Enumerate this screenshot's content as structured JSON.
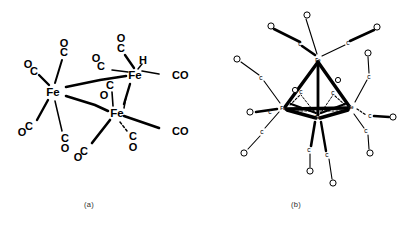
{
  "figure": {
    "background": "#ffffff",
    "ink": "#000000",
    "width": 407,
    "height": 229,
    "captions": [
      {
        "id": "a",
        "label": "(a)"
      },
      {
        "id": "b",
        "label": "(b)"
      }
    ]
  },
  "panel_a": {
    "name": "hydrido-triiron-carbonyl-structure",
    "metal_label": "Fe",
    "hydride_label": "H",
    "carbonyl_label": "CO",
    "carbon_label": "C",
    "oxygen_label": "O",
    "metals": [
      {
        "id": "fe-left",
        "label": "Fe",
        "x": 53,
        "y": 92
      },
      {
        "id": "fe-upper",
        "label": "Fe",
        "x": 135,
        "y": 75
      },
      {
        "id": "fe-lower",
        "label": "Fe",
        "x": 117,
        "y": 113
      }
    ],
    "hydride": {
      "label": "H",
      "x": 143,
      "y": 60
    },
    "terminal_carbonyls": [
      {
        "label": "CO",
        "x": 172,
        "y": 75
      },
      {
        "label": "CO",
        "x": 172,
        "y": 131
      }
    ],
    "split_carbonyls": [
      {
        "c": "C",
        "o": "O",
        "cx": 34,
        "cy": 71,
        "ox": 28,
        "oy": 64
      },
      {
        "c": "C",
        "o": "O",
        "cx": 64,
        "cy": 52,
        "ox": 64,
        "oy": 43
      },
      {
        "c": "C",
        "o": "O",
        "cx": 29,
        "cy": 126,
        "ox": 22,
        "oy": 132
      },
      {
        "c": "C",
        "o": "O",
        "cx": 65,
        "cy": 138,
        "ox": 65,
        "oy": 148
      },
      {
        "c": "C",
        "o": "O",
        "cx": 101,
        "cy": 66,
        "ox": 96,
        "oy": 58
      },
      {
        "c": "C",
        "o": "O",
        "cx": 121,
        "cy": 48,
        "ox": 121,
        "oy": 38
      },
      {
        "c": "C",
        "o": "O",
        "cx": 110,
        "cy": 85,
        "ox": 104,
        "oy": 95
      },
      {
        "c": "C",
        "o": "O",
        "cx": 84,
        "cy": 151,
        "ox": 78,
        "oy": 157
      },
      {
        "c": "C",
        "o": "O",
        "cx": 133,
        "cy": 136,
        "ox": 133,
        "oy": 147
      }
    ]
  },
  "panel_b": {
    "name": "tetrairon-dodecacarbonyl-cluster",
    "metal_label": "Fe",
    "carbon_label": "C",
    "oxygen_label": "O",
    "geometry": "tetrahedral Fe4 core",
    "metals": [
      {
        "id": "fe-top",
        "label": "Fe",
        "x": 318,
        "y": 60
      },
      {
        "id": "fe-left",
        "label": "Fe",
        "x": 283,
        "y": 108
      },
      {
        "id": "fe-right",
        "label": "Fe",
        "x": 351,
        "y": 107
      },
      {
        "id": "fe-front",
        "label": "Fe",
        "x": 318,
        "y": 117
      }
    ],
    "carbonyls": [
      {
        "c": "C",
        "o": "O",
        "cx": 300,
        "cy": 44,
        "ox": 307,
        "oy": 16
      },
      {
        "c": "C",
        "o": "O",
        "cx": 300,
        "cy": 43,
        "ox": 272,
        "oy": 27
      },
      {
        "c": "C",
        "o": "O",
        "cx": 348,
        "cy": 43,
        "ox": 376,
        "oy": 28
      },
      {
        "c": "C",
        "o": "O",
        "cx": 261,
        "cy": 78,
        "ox": 238,
        "oy": 60
      },
      {
        "c": "C",
        "o": "O",
        "cx": 262,
        "cy": 132,
        "ox": 245,
        "oy": 152
      },
      {
        "c": "C",
        "o": "O",
        "cx": 252,
        "cy": 112,
        "ox": 251,
        "oy": 118
      },
      {
        "c": "C",
        "o": "O",
        "cx": 369,
        "cy": 77,
        "ox": 368,
        "oy": 54
      },
      {
        "c": "C",
        "o": "O",
        "cx": 371,
        "cy": 116,
        "ox": 392,
        "oy": 117
      },
      {
        "c": "C",
        "o": "O",
        "cx": 366,
        "cy": 131,
        "ox": 370,
        "oy": 152
      },
      {
        "c": "C",
        "o": "O",
        "cx": 310,
        "cy": 150,
        "ox": 310,
        "oy": 170
      },
      {
        "c": "C",
        "o": "O",
        "cx": 327,
        "cy": 155,
        "ox": 333,
        "oy": 182
      },
      {
        "c": "C",
        "o": "O",
        "cx": 299,
        "cy": 92,
        "ox": 295,
        "oy": 90
      },
      {
        "c": "C",
        "o": "O",
        "cx": 333,
        "cy": 93,
        "ox": 337,
        "oy": 80
      }
    ]
  }
}
